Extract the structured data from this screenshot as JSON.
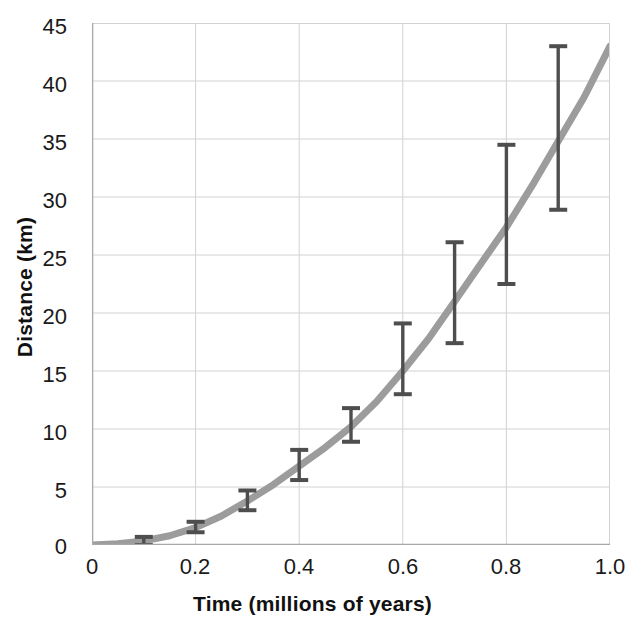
{
  "chart_data": {
    "type": "line",
    "title": "",
    "xlabel": "Time (millions of years)",
    "ylabel": "Distance (km)",
    "xlim": [
      0,
      1.0
    ],
    "ylim": [
      0,
      45
    ],
    "grid": true,
    "legend": null,
    "x_ticks": [
      "0",
      "0.2",
      "0.4",
      "0.6",
      "0.8",
      "1.0"
    ],
    "x_tick_values": [
      0,
      0.2,
      0.4,
      0.6,
      0.8,
      1.0
    ],
    "y_ticks": [
      "0",
      "5",
      "10",
      "15",
      "20",
      "25",
      "30",
      "35",
      "40",
      "45"
    ],
    "y_tick_values": [
      0,
      5,
      10,
      15,
      20,
      25,
      30,
      35,
      40,
      45
    ],
    "series": [
      {
        "name": "model curve",
        "kind": "line",
        "color": "#9c9c9c",
        "linewidth": 7,
        "x": [
          0.0,
          0.05,
          0.1,
          0.15,
          0.2,
          0.25,
          0.3,
          0.35,
          0.4,
          0.45,
          0.5,
          0.55,
          0.6,
          0.65,
          0.7,
          0.75,
          0.8,
          0.85,
          0.9,
          0.95,
          1.0
        ],
        "y": [
          0.0,
          0.1,
          0.35,
          0.8,
          1.5,
          2.5,
          3.8,
          5.2,
          6.8,
          8.4,
          10.2,
          12.4,
          15.0,
          17.8,
          21.0,
          24.2,
          27.4,
          31.0,
          34.8,
          38.6,
          43.0
        ]
      },
      {
        "name": "measurements with error bars",
        "kind": "errorbar",
        "color": "#4e4e4e",
        "x": [
          0.1,
          0.2,
          0.3,
          0.4,
          0.5,
          0.6,
          0.7,
          0.8,
          0.9
        ],
        "y": [
          0.35,
          1.5,
          3.8,
          6.8,
          10.2,
          15.0,
          21.0,
          27.4,
          34.8
        ],
        "y_low": [
          0.0,
          1.1,
          3.0,
          5.6,
          8.9,
          13.0,
          17.4,
          22.5,
          28.9
        ],
        "y_high": [
          0.7,
          2.0,
          4.7,
          8.2,
          11.8,
          19.1,
          26.1,
          34.5,
          43.0
        ]
      }
    ]
  },
  "style": {
    "background": "#ffffff",
    "grid_color": "#d2d2d2",
    "axis_color": "#a8a8a8",
    "text_color": "#1a1a1a",
    "curve_color": "#9c9c9c",
    "errorbar_color": "#4e4e4e"
  }
}
